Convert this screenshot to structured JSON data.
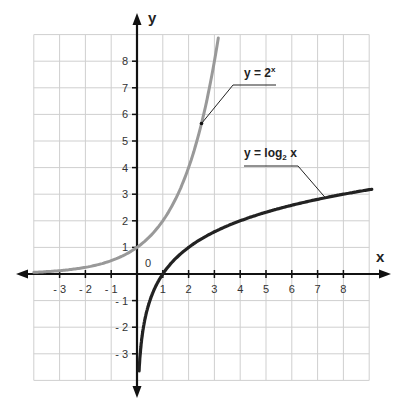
{
  "chart_data": {
    "type": "line",
    "title": "",
    "xlabel": "x",
    "ylabel": "y",
    "origin_label": "0",
    "xlim": [
      -4,
      9
    ],
    "ylim": [
      -4,
      9
    ],
    "grid": true,
    "x_ticks": [
      -3,
      -2,
      -1,
      1,
      2,
      3,
      4,
      5,
      6,
      7,
      8
    ],
    "x_tick_labels": [
      "- 3",
      "- 2",
      "- 1",
      "1",
      "2",
      "3",
      "4",
      "5",
      "6",
      "7",
      "8"
    ],
    "y_ticks": [
      8,
      7,
      6,
      5,
      4,
      3,
      2,
      1,
      -1,
      -2,
      -3
    ],
    "y_tick_labels": [
      "8",
      "7",
      "6",
      "5",
      "4",
      "3",
      "2",
      "1",
      "- 1",
      "- 2",
      "- 3"
    ],
    "series": [
      {
        "name": "y = 2^x",
        "label_main": "y = 2",
        "label_sup": "x",
        "color": "#999999",
        "x": [
          -4,
          -3,
          -2,
          -1,
          0,
          0.5,
          1,
          1.5,
          2,
          2.5,
          3,
          3.17
        ],
        "y": [
          0.0625,
          0.125,
          0.25,
          0.5,
          1,
          1.41,
          2,
          2.83,
          4,
          5.66,
          8,
          9
        ]
      },
      {
        "name": "y = log2 x",
        "label_main": "y = log",
        "label_sub": "2",
        "label_tail": " x",
        "color": "#222222",
        "x": [
          0.08,
          0.125,
          0.25,
          0.5,
          1,
          2,
          3,
          4,
          5,
          6,
          7,
          8,
          9.1
        ],
        "y": [
          -3.64,
          -3,
          -2,
          -1,
          0,
          1,
          1.58,
          2,
          2.32,
          2.58,
          2.81,
          3,
          3.19
        ]
      }
    ],
    "annotations": [
      {
        "text": "y = 2^x",
        "points_to": [
          2.5,
          5.66
        ]
      },
      {
        "text": "y = log2 x",
        "points_to": [
          7.3,
          2.87
        ]
      }
    ]
  }
}
